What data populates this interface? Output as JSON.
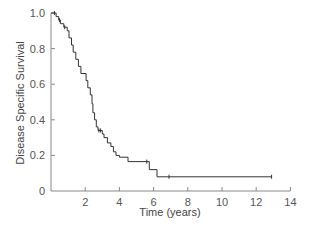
{
  "chart_data": {
    "type": "line",
    "subtype": "kaplan-meier step",
    "title": "",
    "xlabel": "Time (years)",
    "ylabel": "Disease Specific Survival",
    "xlim": [
      0,
      14
    ],
    "ylim": [
      0,
      1.0
    ],
    "x_ticks": [
      2,
      4,
      6,
      8,
      10,
      12,
      14
    ],
    "x_tick_labels": [
      "2",
      "4",
      "6",
      "8",
      "10",
      "12",
      "14"
    ],
    "y_ticks": [
      0,
      0.2,
      0.4,
      0.6,
      0.8,
      1.0
    ],
    "y_tick_labels": [
      "0",
      "0.2",
      "0.4",
      "0.6",
      "0.8",
      "1.0"
    ],
    "grid": false,
    "legend": null,
    "series": [
      {
        "name": "Disease Specific Survival",
        "color": "#333333",
        "step_points": [
          [
            0,
            1.0
          ],
          [
            0.3,
            1.0
          ],
          [
            0.3,
            0.98
          ],
          [
            0.45,
            0.98
          ],
          [
            0.45,
            0.96
          ],
          [
            0.55,
            0.96
          ],
          [
            0.55,
            0.94
          ],
          [
            0.75,
            0.94
          ],
          [
            0.75,
            0.92
          ],
          [
            0.95,
            0.92
          ],
          [
            0.95,
            0.9
          ],
          [
            1.05,
            0.9
          ],
          [
            1.05,
            0.86
          ],
          [
            1.2,
            0.86
          ],
          [
            1.2,
            0.82
          ],
          [
            1.3,
            0.82
          ],
          [
            1.3,
            0.78
          ],
          [
            1.45,
            0.78
          ],
          [
            1.45,
            0.74
          ],
          [
            1.6,
            0.74
          ],
          [
            1.6,
            0.7
          ],
          [
            1.75,
            0.7
          ],
          [
            1.75,
            0.66
          ],
          [
            2.05,
            0.66
          ],
          [
            2.05,
            0.62
          ],
          [
            2.15,
            0.62
          ],
          [
            2.15,
            0.58
          ],
          [
            2.3,
            0.58
          ],
          [
            2.3,
            0.54
          ],
          [
            2.4,
            0.54
          ],
          [
            2.4,
            0.49
          ],
          [
            2.45,
            0.49
          ],
          [
            2.45,
            0.44
          ],
          [
            2.55,
            0.44
          ],
          [
            2.55,
            0.4
          ],
          [
            2.65,
            0.4
          ],
          [
            2.65,
            0.36
          ],
          [
            2.75,
            0.36
          ],
          [
            2.75,
            0.34
          ],
          [
            3.0,
            0.34
          ],
          [
            3.0,
            0.32
          ],
          [
            3.1,
            0.32
          ],
          [
            3.1,
            0.3
          ],
          [
            3.3,
            0.3
          ],
          [
            3.3,
            0.27
          ],
          [
            3.5,
            0.27
          ],
          [
            3.5,
            0.25
          ],
          [
            3.65,
            0.25
          ],
          [
            3.65,
            0.22
          ],
          [
            3.8,
            0.22
          ],
          [
            3.8,
            0.2
          ],
          [
            4.0,
            0.2
          ],
          [
            4.0,
            0.19
          ],
          [
            4.5,
            0.19
          ],
          [
            4.5,
            0.165
          ],
          [
            5.75,
            0.165
          ],
          [
            5.75,
            0.12
          ],
          [
            6.2,
            0.12
          ],
          [
            6.2,
            0.08
          ],
          [
            12.9,
            0.08
          ]
        ],
        "censor_marks": [
          [
            0.2,
            1.0
          ],
          [
            0.5,
            0.96
          ],
          [
            0.8,
            0.92
          ],
          [
            2.8,
            0.34
          ],
          [
            2.9,
            0.34
          ],
          [
            5.6,
            0.165
          ],
          [
            6.9,
            0.08
          ],
          [
            12.9,
            0.08
          ]
        ]
      }
    ]
  }
}
